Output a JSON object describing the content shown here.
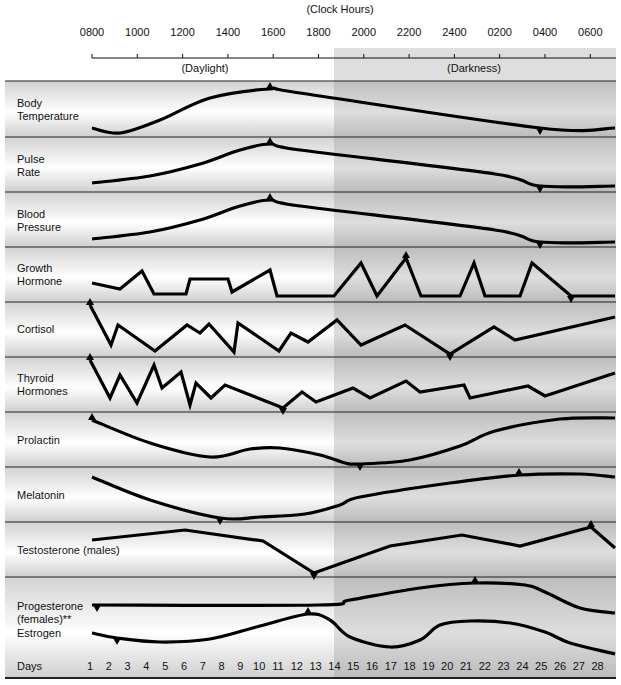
{
  "chart_data": {
    "type": "line",
    "title": "(Clock Hours)",
    "xlabel_top": "(Clock Hours)",
    "xlabel_bottom": "Days",
    "periods": [
      {
        "label": "(Daylight)",
        "from": "0800",
        "to": "1900"
      },
      {
        "label": "(Darkness)",
        "from": "1900",
        "to": "0700"
      }
    ],
    "clock_ticks": [
      "0800",
      "1000",
      "1200",
      "1400",
      "1600",
      "1800",
      "2000",
      "2200",
      "2400",
      "0200",
      "0400",
      "0600"
    ],
    "day_ticks": [
      "1",
      "2",
      "3",
      "4",
      "5",
      "6",
      "7",
      "8",
      "9",
      "10",
      "11",
      "12",
      "13",
      "14",
      "15",
      "16",
      "17",
      "18",
      "19",
      "20",
      "21",
      "22",
      "23",
      "24",
      "25",
      "26",
      "27",
      "28"
    ],
    "series": [
      {
        "name": "Body Temperature",
        "label_lines": [
          "Body",
          "Temperature"
        ],
        "axis": "clock",
        "peak": "1600",
        "trough": "0400",
        "points": [
          [
            92,
            128
          ],
          [
            120,
            133
          ],
          [
            160,
            120
          ],
          [
            210,
            98
          ],
          [
            270,
            89
          ],
          [
            300,
            93
          ],
          [
            540,
            128
          ],
          [
            615,
            128
          ]
        ],
        "markers": [
          {
            "x": 270,
            "dir": "up"
          },
          {
            "x": 540,
            "dir": "down"
          }
        ]
      },
      {
        "name": "Pulse Rate",
        "label_lines": [
          "Pulse",
          "Rate"
        ],
        "axis": "clock",
        "peak": "1600",
        "trough": "0400",
        "points": [
          [
            92,
            183
          ],
          [
            150,
            176
          ],
          [
            200,
            164
          ],
          [
            240,
            150
          ],
          [
            270,
            144
          ],
          [
            300,
            150
          ],
          [
            495,
            174
          ],
          [
            540,
            186
          ],
          [
            615,
            186
          ]
        ],
        "markers": [
          {
            "x": 270,
            "dir": "up"
          },
          {
            "x": 540,
            "dir": "down"
          }
        ]
      },
      {
        "name": "Blood Pressure",
        "label_lines": [
          "Blood",
          "Pressure"
        ],
        "axis": "clock",
        "peak": "1600",
        "trough": "0400",
        "points": [
          [
            92,
            239
          ],
          [
            150,
            232
          ],
          [
            200,
            220
          ],
          [
            240,
            206
          ],
          [
            270,
            200
          ],
          [
            300,
            206
          ],
          [
            495,
            230
          ],
          [
            540,
            242
          ],
          [
            615,
            242
          ]
        ],
        "markers": [
          {
            "x": 270,
            "dir": "up"
          },
          {
            "x": 540,
            "dir": "down"
          }
        ]
      },
      {
        "name": "Growth Hormone",
        "label_lines": [
          "Growth",
          "Hormone"
        ],
        "axis": "clock",
        "points": [
          [
            92,
            283
          ],
          [
            120,
            289
          ],
          [
            142,
            271
          ],
          [
            154,
            294
          ],
          [
            186,
            294
          ],
          [
            190,
            279
          ],
          [
            228,
            279
          ],
          [
            232,
            292
          ],
          [
            270,
            270
          ],
          [
            277,
            296
          ],
          [
            334,
            296
          ],
          [
            361,
            263
          ],
          [
            377,
            296
          ],
          [
            406,
            258
          ],
          [
            421,
            296
          ],
          [
            460,
            296
          ],
          [
            474,
            263
          ],
          [
            485,
            296
          ],
          [
            520,
            296
          ],
          [
            532,
            263
          ],
          [
            571,
            296
          ],
          [
            615,
            296
          ]
        ],
        "markers": [
          {
            "x": 406,
            "dir": "up"
          },
          {
            "x": 571,
            "dir": "down"
          }
        ]
      },
      {
        "name": "Cortisol",
        "label_lines": [
          "Cortisol"
        ],
        "axis": "clock",
        "points": [
          [
            90,
            305
          ],
          [
            111,
            345
          ],
          [
            118,
            325
          ],
          [
            155,
            351
          ],
          [
            187,
            325
          ],
          [
            200,
            333
          ],
          [
            209,
            324
          ],
          [
            234,
            352
          ],
          [
            238,
            323
          ],
          [
            279,
            351
          ],
          [
            291,
            333
          ],
          [
            308,
            342
          ],
          [
            337,
            320
          ],
          [
            361,
            345
          ],
          [
            405,
            325
          ],
          [
            450,
            354
          ],
          [
            494,
            327
          ],
          [
            515,
            340
          ],
          [
            615,
            317
          ]
        ],
        "markers": [
          {
            "x": 90,
            "dir": "up"
          },
          {
            "x": 450,
            "dir": "down"
          }
        ]
      },
      {
        "name": "Thyroid Hormones",
        "label_lines": [
          "Thyroid",
          "Hormones"
        ],
        "axis": "clock",
        "points": [
          [
            90,
            360
          ],
          [
            110,
            398
          ],
          [
            120,
            375
          ],
          [
            137,
            403
          ],
          [
            154,
            365
          ],
          [
            162,
            388
          ],
          [
            181,
            372
          ],
          [
            190,
            405
          ],
          [
            196,
            383
          ],
          [
            211,
            398
          ],
          [
            225,
            385
          ],
          [
            283,
            408
          ],
          [
            302,
            392
          ],
          [
            316,
            402
          ],
          [
            353,
            388
          ],
          [
            370,
            398
          ],
          [
            406,
            381
          ],
          [
            420,
            392
          ],
          [
            464,
            385
          ],
          [
            470,
            398
          ],
          [
            528,
            386
          ],
          [
            545,
            396
          ],
          [
            615,
            373
          ]
        ],
        "markers": [
          {
            "x": 90,
            "dir": "up"
          },
          {
            "x": 283,
            "dir": "down"
          }
        ]
      },
      {
        "name": "Prolactin",
        "label_lines": [
          "Prolactin"
        ],
        "axis": "clock",
        "points": [
          [
            92,
            420
          ],
          [
            150,
            443
          ],
          [
            210,
            457
          ],
          [
            250,
            449
          ],
          [
            280,
            448
          ],
          [
            320,
            455
          ],
          [
            345,
            463
          ],
          [
            360,
            464
          ],
          [
            410,
            460
          ],
          [
            460,
            446
          ],
          [
            495,
            431
          ],
          [
            560,
            419
          ],
          [
            615,
            418
          ]
        ],
        "markers": [
          {
            "x": 92,
            "dir": "up"
          },
          {
            "x": 360,
            "dir": "down"
          }
        ]
      },
      {
        "name": "Melatonin",
        "label_lines": [
          "Melatonin"
        ],
        "axis": "clock",
        "points": [
          [
            92,
            477
          ],
          [
            150,
            500
          ],
          [
            220,
            518
          ],
          [
            260,
            517
          ],
          [
            305,
            514
          ],
          [
            340,
            505
          ],
          [
            360,
            497
          ],
          [
            450,
            483
          ],
          [
            520,
            475
          ],
          [
            580,
            474
          ],
          [
            615,
            477
          ]
        ],
        "markers": [
          {
            "x": 220,
            "dir": "down"
          },
          {
            "x": 519,
            "dir": "up"
          }
        ]
      },
      {
        "name": "Testosterone (males)",
        "label_lines": [
          "Testosterone (males)"
        ],
        "axis": "clock",
        "points": [
          [
            92,
            540
          ],
          [
            185,
            530
          ],
          [
            263,
            541
          ],
          [
            314,
            573
          ],
          [
            390,
            546
          ],
          [
            462,
            535
          ],
          [
            520,
            546
          ],
          [
            591,
            527
          ],
          [
            615,
            548
          ]
        ],
        "markers": [
          {
            "x": 314,
            "dir": "down"
          },
          {
            "x": 591,
            "dir": "up"
          }
        ]
      },
      {
        "name": "Progesterone (females)**",
        "label_lines": [
          "Progesterone",
          "(females)**"
        ],
        "axis": "days",
        "points": [
          [
            92,
            605
          ],
          [
            318,
            605
          ],
          [
            350,
            600
          ],
          [
            420,
            588
          ],
          [
            475,
            583
          ],
          [
            525,
            585
          ],
          [
            545,
            592
          ],
          [
            580,
            608
          ],
          [
            615,
            613
          ]
        ],
        "markers": [
          {
            "x": 97,
            "dir": "down"
          },
          {
            "x": 475,
            "dir": "up"
          }
        ]
      },
      {
        "name": "Estrogen",
        "label_lines": [
          "Estrogen"
        ],
        "axis": "days",
        "points": [
          [
            92,
            633
          ],
          [
            117,
            638
          ],
          [
            160,
            642
          ],
          [
            210,
            639
          ],
          [
            260,
            626
          ],
          [
            308,
            614
          ],
          [
            330,
            620
          ],
          [
            350,
            637
          ],
          [
            390,
            647
          ],
          [
            420,
            640
          ],
          [
            440,
            625
          ],
          [
            470,
            621
          ],
          [
            510,
            623
          ],
          [
            545,
            632
          ],
          [
            570,
            643
          ],
          [
            615,
            654
          ]
        ],
        "markers": [
          {
            "x": 117,
            "dir": "down"
          },
          {
            "x": 308,
            "dir": "up"
          }
        ]
      }
    ],
    "layout": {
      "grid": false,
      "legend": "left row labels",
      "panel_separators_y": [
        81,
        137,
        192,
        247,
        302,
        357,
        412,
        467,
        522,
        577
      ],
      "bottom_rule_y": 678,
      "darkness_from_x": 334
    }
  },
  "header": {
    "clock_hours": "(Clock Hours)",
    "daylight": "(Daylight)",
    "darkness": "(Darkness)"
  },
  "footer": {
    "days_label": "Days"
  },
  "colors": {
    "line": "#000000",
    "darkness": "#c8c8c8",
    "panel_edge": "#d0d0d0",
    "separator": "#222222"
  }
}
